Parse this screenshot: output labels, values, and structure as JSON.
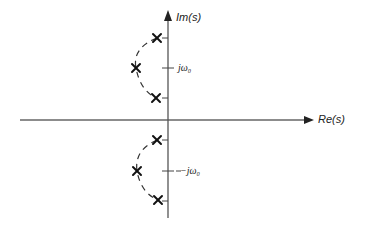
{
  "diagram": {
    "type": "s-plane pole plot",
    "axes": {
      "imag_label": "Im(s)",
      "real_label": "Re(s)"
    },
    "tick_labels": {
      "upper": "jω₀",
      "lower": "−jω₀"
    },
    "poles": {
      "upper_group": [
        {
          "x": 157,
          "y": 38
        },
        {
          "x": 136,
          "y": 68
        },
        {
          "x": 156,
          "y": 98
        }
      ],
      "lower_group": [
        {
          "x": 157,
          "y": 140
        },
        {
          "x": 137,
          "y": 171
        },
        {
          "x": 158,
          "y": 200
        }
      ]
    },
    "colors": {
      "line": "#333333",
      "axis": "#555555"
    }
  }
}
